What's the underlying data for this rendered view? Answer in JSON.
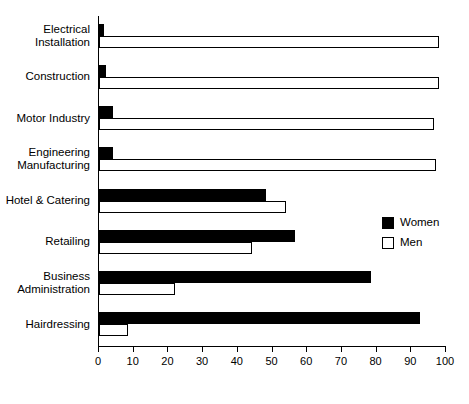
{
  "chart_data": {
    "type": "bar",
    "orientation": "horizontal",
    "title": "",
    "xlabel": "",
    "ylabel": "",
    "xlim": [
      0,
      100
    ],
    "xticks": [
      0,
      10,
      20,
      30,
      40,
      50,
      60,
      70,
      80,
      90,
      100
    ],
    "xtick_labels": [
      "0",
      "10",
      "20",
      "30",
      "40",
      "50",
      "60",
      "70",
      "80",
      "90",
      "100"
    ],
    "grid": false,
    "legend_position": "center-right",
    "categories": [
      "Electrical Installation",
      "Construction",
      "Motor Industry",
      "Engineering Manufacturing",
      "Hotel & Catering",
      "Retailing",
      "Business Administration",
      "Hairdressing"
    ],
    "category_lines": [
      [
        "Electrical",
        "Installation"
      ],
      [
        "Construction"
      ],
      [
        "Motor Industry"
      ],
      [
        "Engineering",
        "Manufacturing"
      ],
      [
        "Hotel & Catering"
      ],
      [
        "Retailing"
      ],
      [
        "Business",
        "Administration"
      ],
      [
        "Hairdressing"
      ]
    ],
    "series": [
      {
        "name": "Women",
        "color": "#000000",
        "fill": "solid",
        "values": [
          1.5,
          2,
          4,
          4,
          48,
          56.5,
          78.5,
          92.5
        ]
      },
      {
        "name": "Men",
        "color": "#ffffff",
        "fill": "outline",
        "values": [
          98,
          98,
          96.5,
          97,
          54,
          44,
          22,
          8.5
        ]
      }
    ]
  },
  "legend": {
    "items": [
      {
        "label": "Women",
        "swatch": "filled-black-square"
      },
      {
        "label": "Men",
        "swatch": "open-white-square"
      }
    ]
  },
  "colors": {
    "women": "#000000",
    "men": "#ffffff",
    "axis": "#000000",
    "background": "#ffffff"
  }
}
